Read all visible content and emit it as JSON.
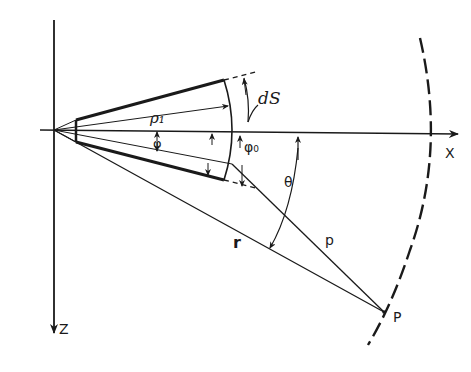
{
  "diagram": {
    "type": "geometry",
    "colors": {
      "ink": "#1a1a1a",
      "background": "#ffffff"
    },
    "labels": {
      "x_axis": "X",
      "z_axis": "Z",
      "rho1": "ρ₁",
      "phi": "φ",
      "phi0": "φ₀",
      "dS": "dS",
      "theta": "θ",
      "r": "r",
      "p_line": "p",
      "P_point": "P"
    },
    "elements": [
      {
        "name": "x-axis",
        "kind": "arrow",
        "direction": "right"
      },
      {
        "name": "z-axis",
        "kind": "arrow",
        "direction": "down"
      },
      {
        "name": "sector",
        "kind": "annular-sector",
        "edges": [
          "thick-top",
          "thick-bottom",
          "inner-edge",
          "outer-arc"
        ]
      },
      {
        "name": "far-field-arc",
        "kind": "dashed-arc"
      },
      {
        "name": "line-r",
        "from": "origin",
        "to": "P"
      },
      {
        "name": "line-p",
        "from": "sector-point",
        "to": "P"
      },
      {
        "name": "angle-theta",
        "between": [
          "x-axis",
          "line-r"
        ]
      }
    ]
  }
}
